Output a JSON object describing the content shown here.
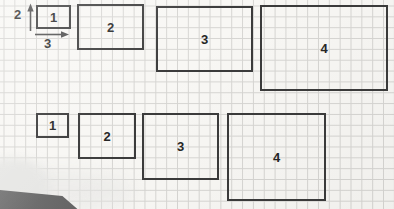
{
  "figure": {
    "dimension_annotation": {
      "height_label": "2",
      "width_label": "3"
    },
    "grid": {
      "cell_px": 11
    },
    "rows": [
      {
        "name": "top-row",
        "rects": [
          {
            "label": "1",
            "grid_w": 3,
            "grid_h": 2
          },
          {
            "label": "2",
            "grid_w": 6,
            "grid_h": 4
          },
          {
            "label": "3",
            "grid_w": 9,
            "grid_h": 6
          },
          {
            "label": "4",
            "grid_w": 12,
            "grid_h": 8
          }
        ]
      },
      {
        "name": "bottom-row",
        "rects": [
          {
            "label": "1",
            "grid_w": 3,
            "grid_h": 2
          },
          {
            "label": "2",
            "grid_w": 5,
            "grid_h": 4
          },
          {
            "label": "3",
            "grid_w": 7,
            "grid_h": 6
          },
          {
            "label": "4",
            "grid_w": 9,
            "grid_h": 8
          }
        ]
      }
    ],
    "colors": {
      "paper": "#f8f7f4",
      "grid_line": "#d6d5d2",
      "rect_stroke": "#3b3b3b",
      "label_text": "#262626",
      "arrow": "#4a4a4a",
      "corner_object": "#6b6b6b",
      "corner_shadow": "#e7e7e5"
    }
  }
}
